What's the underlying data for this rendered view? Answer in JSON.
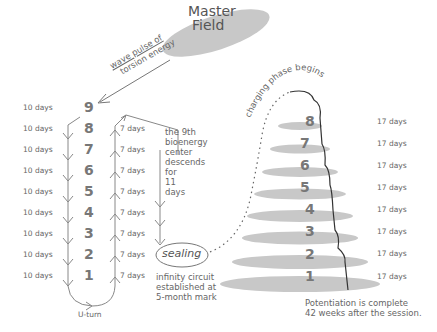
{
  "master_field": {
    "line1": "Master",
    "line2": "Field"
  },
  "wave_pulse": {
    "line1": "wave pulse of",
    "line2": "torsion energy"
  },
  "left_column": {
    "numbers": [
      "9",
      "8",
      "7",
      "6",
      "5",
      "4",
      "3",
      "2",
      "1"
    ],
    "descend_days": [
      "10 days",
      "10 days",
      "10 days",
      "10 days",
      "10 days",
      "10 days",
      "10 days",
      "10 days",
      "10 days"
    ],
    "ascend_days": [
      "7 days",
      "7 days",
      "7 days",
      "7 days",
      "7 days",
      "7 days",
      "7 days",
      "7 days"
    ],
    "uturn_label": "U-turn"
  },
  "ninth_center_note": {
    "lines": [
      "the 9th",
      "bioenergy",
      "center",
      "descends",
      "for",
      "11",
      "days"
    ]
  },
  "sealing": {
    "label": "sealing",
    "note_lines": [
      "infinity circuit",
      "established at",
      "5-month mark"
    ]
  },
  "charging": {
    "label": "charging phase begins",
    "numbers": [
      "8",
      "7",
      "6",
      "5",
      "4",
      "3",
      "2",
      "1"
    ],
    "days": [
      "17 days",
      "17 days",
      "17 days",
      "17 days",
      "17 days",
      "17 days",
      "17 days",
      "17 days"
    ]
  },
  "potentiation": {
    "line1": "Potentiation is complete",
    "line2": "42 weeks after the session."
  },
  "colors": {
    "ellipse": "#c8c8c8",
    "line": "#777777",
    "text": "#666666"
  }
}
